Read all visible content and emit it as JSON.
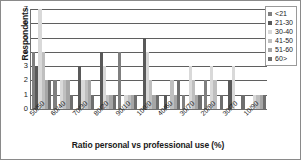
{
  "chart_data": {
    "type": "bar",
    "title": "",
    "xlabel": "Ratio personal vs professional use (%)",
    "ylabel": "Respondents",
    "ylim": [
      0,
      7
    ],
    "yticks": [
      0,
      1,
      2,
      3,
      4,
      5,
      6,
      7
    ],
    "grid": true,
    "legend_position": "top-right",
    "legend_title": "",
    "categories": [
      "50/50",
      "60/40",
      "70/30",
      "80/20",
      "90/10",
      "100/0",
      "40/60",
      "30/70",
      "20/80",
      "30/70",
      "10/90"
    ],
    "series": [
      {
        "name": "<21",
        "color": "#7f7f7f",
        "values": [
          4,
          2,
          0,
          0,
          4,
          0,
          0,
          1,
          2,
          0,
          0
        ]
      },
      {
        "name": "21-30",
        "color": "#595959",
        "values": [
          3,
          0,
          3,
          4,
          0,
          5,
          1,
          0,
          0,
          2,
          0
        ]
      },
      {
        "name": "30-40",
        "color": "#d9d9d9",
        "values": [
          7,
          2,
          2,
          3,
          1,
          4,
          0,
          3,
          3,
          3,
          1
        ]
      },
      {
        "name": "41-50",
        "color": "#bfbfbf",
        "values": [
          4,
          2,
          2,
          1,
          1,
          2,
          2,
          2,
          2,
          0,
          1
        ]
      },
      {
        "name": "51-60",
        "color": "#a6a6a6",
        "values": [
          2,
          2,
          2,
          1,
          1,
          1,
          1,
          1,
          0,
          0,
          1
        ]
      },
      {
        "name": "60>",
        "color": "#6e6e6e",
        "values": [
          2,
          1,
          1,
          1,
          1,
          1,
          2,
          1,
          1,
          1,
          1
        ]
      }
    ]
  },
  "legend": {
    "items": [
      {
        "label": "<21"
      },
      {
        "label": "21-30"
      },
      {
        "label": "30-40"
      },
      {
        "label": "41-50"
      },
      {
        "label": "51-60"
      },
      {
        "label": "60>"
      }
    ]
  }
}
